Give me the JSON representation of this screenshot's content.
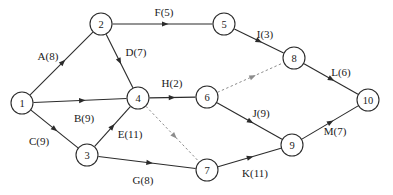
{
  "diagram": {
    "type": "directed-network-graph",
    "title": "",
    "canvas": {
      "width": 393,
      "height": 195
    },
    "colors": {
      "background": "#ffffff",
      "node_stroke": "#2b2b2b",
      "node_fill": "#ffffff",
      "edge_solid": "#2b2b2b",
      "edge_dashed": "#8c8c8c",
      "text": "#1a1a1a"
    },
    "node_radius": 11,
    "nodes": [
      {
        "id": "1",
        "label": "1",
        "x": 22,
        "y": 103
      },
      {
        "id": "2",
        "label": "2",
        "x": 101,
        "y": 24
      },
      {
        "id": "3",
        "label": "3",
        "x": 87,
        "y": 155
      },
      {
        "id": "4",
        "label": "4",
        "x": 138,
        "y": 98
      },
      {
        "id": "5",
        "label": "5",
        "x": 224,
        "y": 24
      },
      {
        "id": "6",
        "label": "6",
        "x": 207,
        "y": 97
      },
      {
        "id": "7",
        "label": "7",
        "x": 207,
        "y": 170
      },
      {
        "id": "8",
        "label": "8",
        "x": 294,
        "y": 58
      },
      {
        "id": "9",
        "label": "9",
        "x": 292,
        "y": 145
      },
      {
        "id": "10",
        "label": "10",
        "x": 368,
        "y": 100
      }
    ],
    "edges": [
      {
        "id": "A",
        "from": "1",
        "to": "2",
        "label": "A(8)",
        "activity": "A",
        "weight": 8,
        "style": "solid",
        "label_x": 48,
        "label_y": 56
      },
      {
        "id": "B",
        "from": "1",
        "to": "4",
        "label": "B(9)",
        "activity": "B",
        "weight": 9,
        "style": "solid",
        "label_x": 84,
        "label_y": 118
      },
      {
        "id": "C",
        "from": "1",
        "to": "3",
        "label": "C(9)",
        "activity": "C",
        "weight": 9,
        "style": "solid",
        "label_x": 39,
        "label_y": 141
      },
      {
        "id": "D",
        "from": "2",
        "to": "4",
        "label": "D(7)",
        "activity": "D",
        "weight": 7,
        "style": "solid",
        "label_x": 136,
        "label_y": 52
      },
      {
        "id": "E",
        "from": "3",
        "to": "4",
        "label": "E(11)",
        "activity": "E",
        "weight": 11,
        "style": "solid",
        "label_x": 130,
        "label_y": 134
      },
      {
        "id": "F",
        "from": "2",
        "to": "5",
        "label": "F(5)",
        "activity": "F",
        "weight": 5,
        "style": "solid",
        "label_x": 164,
        "label_y": 12
      },
      {
        "id": "G",
        "from": "3",
        "to": "7",
        "label": "G(8)",
        "activity": "G",
        "weight": 8,
        "style": "solid",
        "label_x": 143,
        "label_y": 180
      },
      {
        "id": "H",
        "from": "4",
        "to": "6",
        "label": "H(2)",
        "activity": "H",
        "weight": 2,
        "style": "solid",
        "label_x": 172,
        "label_y": 83
      },
      {
        "id": "I",
        "from": "5",
        "to": "8",
        "label": "I(3)",
        "activity": "I",
        "weight": 3,
        "style": "solid",
        "label_x": 265,
        "label_y": 34
      },
      {
        "id": "J",
        "from": "6",
        "to": "9",
        "label": "J(9)",
        "activity": "J",
        "weight": 9,
        "style": "solid",
        "label_x": 261,
        "label_y": 113
      },
      {
        "id": "K",
        "from": "7",
        "to": "9",
        "label": "K(11)",
        "activity": "K",
        "weight": 11,
        "style": "solid",
        "label_x": 255,
        "label_y": 173
      },
      {
        "id": "L",
        "from": "8",
        "to": "10",
        "label": "L(6)",
        "activity": "L",
        "weight": 6,
        "style": "solid",
        "label_x": 341,
        "label_y": 72
      },
      {
        "id": "M",
        "from": "9",
        "to": "10",
        "label": "M(7)",
        "activity": "M",
        "weight": 7,
        "style": "solid",
        "label_x": 335,
        "label_y": 131
      },
      {
        "id": "d1",
        "from": "6",
        "to": "8",
        "label": "",
        "activity": "",
        "weight": null,
        "style": "dashed",
        "label_x": 0,
        "label_y": 0
      },
      {
        "id": "d2",
        "from": "4",
        "to": "7",
        "label": "",
        "activity": "",
        "weight": null,
        "style": "dashed",
        "label_x": 0,
        "label_y": 0
      }
    ]
  }
}
